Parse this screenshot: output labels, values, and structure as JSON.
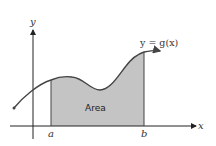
{
  "diagram": {
    "type": "area-under-curve",
    "axes": {
      "x_label": "x",
      "y_label": "y"
    },
    "curve_label": "y = g(x)",
    "region_label": "Area",
    "bounds": {
      "lower": "a",
      "upper": "b"
    },
    "colors": {
      "fill": "#c4c4c4",
      "stroke": "#444444",
      "axis": "#222222"
    }
  }
}
